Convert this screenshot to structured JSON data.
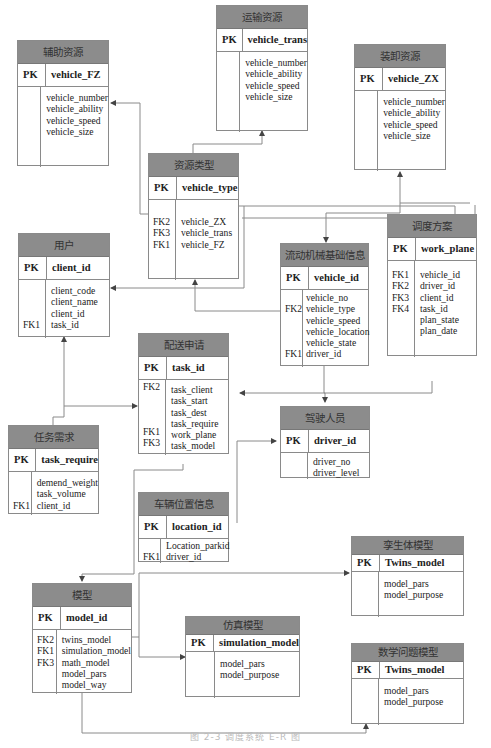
{
  "diagram": {
    "type": "E-R diagram",
    "caption": "图 2-3  调度系统 E-R 图",
    "entities": {
      "fz": {
        "title": "辅助资源",
        "pk_label": "PK",
        "pk": "vehicle_FZ",
        "keys": [
          "",
          "",
          "",
          ""
        ],
        "attrs": [
          "vehicle_number",
          "vehicle_ability",
          "vehicle_speed",
          "vehicle_size"
        ]
      },
      "trans": {
        "title": "运输资源",
        "pk_label": "PK",
        "pk": "vehicle_trans",
        "keys": [
          "",
          "",
          "",
          ""
        ],
        "attrs": [
          "vehicle_number",
          "vehicle_ability",
          "vehicle_speed",
          "vehicle_size"
        ]
      },
      "zx": {
        "title": "装卸资源",
        "pk_label": "PK",
        "pk": "vehicle_ZX",
        "keys": [
          "",
          "",
          "",
          ""
        ],
        "attrs": [
          "vehicle_number",
          "vehicle_ability",
          "vehicle_speed",
          "vehicle_size"
        ]
      },
      "type": {
        "title": "资源类型",
        "pk_label": "PK",
        "pk": "vehicle_type",
        "keys": [
          "",
          "FK2",
          "FK3",
          "FK1"
        ],
        "attrs": [
          "",
          "vehicle_ZX",
          "vehicle_trans",
          "vehicle_FZ"
        ]
      },
      "client": {
        "title": "用户",
        "pk_label": "PK",
        "pk": "client_id",
        "keys": [
          "",
          "",
          "",
          "FK1"
        ],
        "attrs": [
          "client_code",
          "client_name",
          "client_id",
          "task_id"
        ]
      },
      "mech": {
        "title": "流动机械基础信息",
        "pk_label": "PK",
        "pk": "vehicle_id",
        "keys": [
          "",
          "FK2",
          "",
          "",
          "",
          "FK1"
        ],
        "attrs": [
          "vehicle_no",
          "vehicle_type",
          "vehicle_speed",
          "vehicle_location",
          "vehicle_state",
          "driver_id"
        ]
      },
      "plan": {
        "title": "调度方案",
        "pk_label": "PK",
        "pk": "work_plane",
        "keys": [
          "FK1",
          "FK2",
          "FK3",
          "FK4",
          "",
          ""
        ],
        "attrs": [
          "vehicle_id",
          "driver_id",
          "client_id",
          "task_id",
          "plan_state",
          "plan_date"
        ]
      },
      "task": {
        "title": "配送申请",
        "pk_label": "PK",
        "pk": "task_id",
        "keys": [
          "FK2",
          "",
          "",
          "",
          "FK1",
          "FK3"
        ],
        "attrs": [
          "task_client",
          "task_start",
          "task_dest",
          "task_require",
          "work_plane",
          "task_model"
        ]
      },
      "driver": {
        "title": "驾驶人员",
        "pk_label": "PK",
        "pk": "driver_id",
        "keys": [
          "",
          ""
        ],
        "attrs": [
          "driver_no",
          "driver_level"
        ]
      },
      "req": {
        "title": "任务需求",
        "pk_label": "PK",
        "pk": "task_require",
        "keys": [
          "",
          "",
          "FK1"
        ],
        "attrs": [
          "demend_weight",
          "task_volume",
          "client_id"
        ]
      },
      "loc": {
        "title": "车辆位置信息",
        "pk_label": "PK",
        "pk": "location_id",
        "keys": [
          "",
          "FK1"
        ],
        "attrs": [
          "Location_parkid",
          "driver_id"
        ]
      },
      "model": {
        "title": "模型",
        "pk_label": "PK",
        "pk": "model_id",
        "keys": [
          "FK2",
          "FK1",
          "FK3",
          "",
          ""
        ],
        "attrs": [
          "twins_model",
          "simulation_model",
          "math_model",
          "model_pars",
          "model_way"
        ]
      },
      "twins": {
        "title": "孪生体模型",
        "pk_label": "PK",
        "pk": "Twins_model",
        "keys": [
          "",
          ""
        ],
        "attrs": [
          "model_pars",
          "model_purpose"
        ]
      },
      "sim": {
        "title": "仿真模型",
        "pk_label": "PK",
        "pk": "simulation_model",
        "keys": [
          "",
          ""
        ],
        "attrs": [
          "model_pars",
          "model_purpose"
        ]
      },
      "math": {
        "title": "数学问题模型",
        "pk_label": "PK",
        "pk": "Twins_model",
        "keys": [
          "",
          ""
        ],
        "attrs": [
          "model_pars",
          "model_purpose"
        ]
      }
    },
    "relationships": [
      {
        "from": "资源类型",
        "to": "辅助资源"
      },
      {
        "from": "资源类型",
        "to": "运输资源"
      },
      {
        "from": "资源类型",
        "to": "装卸资源"
      },
      {
        "from": "流动机械基础信息",
        "to": "资源类型"
      },
      {
        "from": "调度方案",
        "to": "流动机械基础信息"
      },
      {
        "from": "调度方案",
        "to": "用户"
      },
      {
        "from": "任务需求",
        "to": "用户"
      },
      {
        "from": "任务需求",
        "to": "配送申请"
      },
      {
        "from": "调度方案",
        "to": "配送申请"
      },
      {
        "from": "流动机械基础信息",
        "to": "驾驶人员"
      },
      {
        "from": "车辆位置信息",
        "to": "驾驶人员"
      },
      {
        "from": "配送申请",
        "to": "模型"
      },
      {
        "from": "模型",
        "to": "孪生体模型"
      },
      {
        "from": "模型",
        "to": "仿真模型"
      },
      {
        "from": "模型",
        "to": "数学问题模型"
      }
    ]
  }
}
